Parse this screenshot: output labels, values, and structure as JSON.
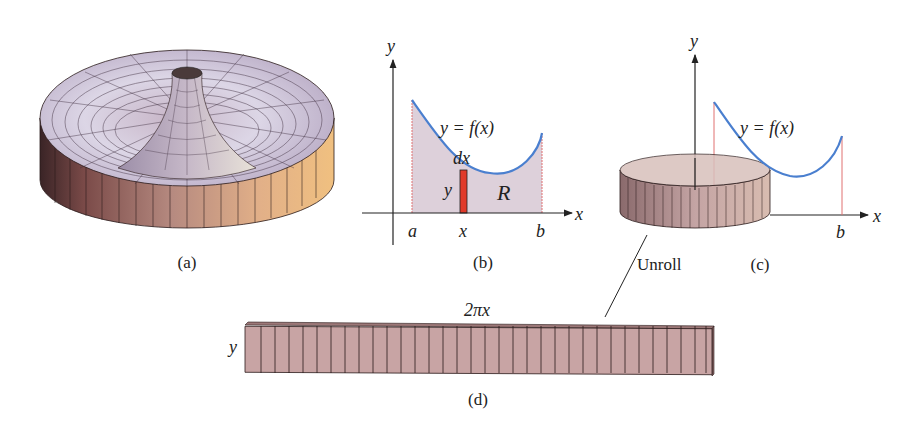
{
  "panels": {
    "a": {
      "caption": "(a)"
    },
    "b": {
      "caption": "(b)",
      "y_axis": "y",
      "x_axis": "x",
      "curve_label": "y = f(x)",
      "dx_label": "dx",
      "strip_height_label": "y",
      "region_label": "R",
      "tick_a": "a",
      "tick_x": "x",
      "tick_b": "b"
    },
    "c": {
      "caption": "(c)",
      "y_axis": "y",
      "x_axis": "x",
      "curve_label": "y = f(x)",
      "tick_b": "b"
    },
    "d": {
      "caption": "(d)",
      "width_label": "2πx",
      "height_label": "y"
    }
  },
  "annotation": {
    "unroll": "Unroll"
  },
  "colors": {
    "curve": "#4a7fcf",
    "strip": "#e03a2a",
    "region": "#d9ccd6",
    "shell": "#b89392",
    "guide": "#e07070"
  }
}
